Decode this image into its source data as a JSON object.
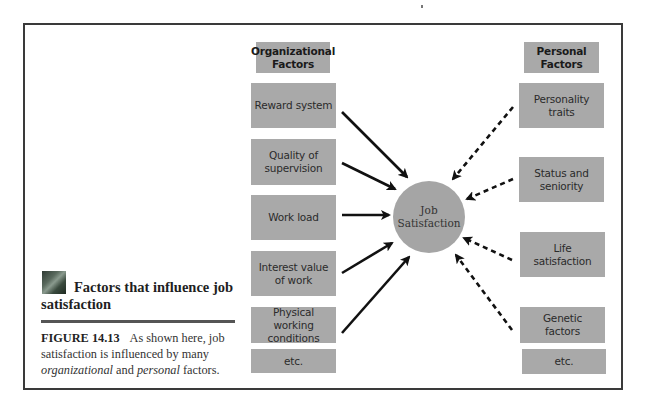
{
  "figure": {
    "title_line1": "Factors that influence job",
    "title_line2": "satisfaction",
    "thumbnail_icon": "photo-thumbnail",
    "caption": {
      "label": "FIGURE 14.13",
      "text_part1": "As shown here, job satisfaction is influenced by many",
      "italic1": "organizational",
      "text_and": "and",
      "italic2": "personal",
      "text_end": "factors."
    }
  },
  "diagram": {
    "center": {
      "line1": "Job",
      "line2": "Satisfaction"
    },
    "organizational": {
      "header": {
        "line1": "Organizational",
        "line2": "Factors"
      },
      "items": [
        {
          "line1": "Reward system",
          "line2": ""
        },
        {
          "line1": "Quality of",
          "line2": "supervision"
        },
        {
          "line1": "Work load",
          "line2": ""
        },
        {
          "line1": "Interest value",
          "line2": "of work"
        },
        {
          "line1": "Physical working",
          "line2": "conditions"
        },
        {
          "line1": "etc.",
          "line2": ""
        }
      ],
      "arrow_style": "solid"
    },
    "personal": {
      "header": {
        "line1": "Personal",
        "line2": "Factors"
      },
      "items": [
        {
          "line1": "Personality",
          "line2": "traits"
        },
        {
          "line1": "Status and",
          "line2": "seniority"
        },
        {
          "line1": "Life",
          "line2": "satisfaction"
        },
        {
          "line1": "Genetic",
          "line2": "factors"
        },
        {
          "line1": "etc.",
          "line2": ""
        }
      ],
      "arrow_style": "dashed"
    },
    "colors": {
      "box_fill": "#a9a9a9",
      "circle_fill": "#a5a5a5",
      "arrow": "#111111",
      "frame": "#3a3a3a"
    }
  }
}
